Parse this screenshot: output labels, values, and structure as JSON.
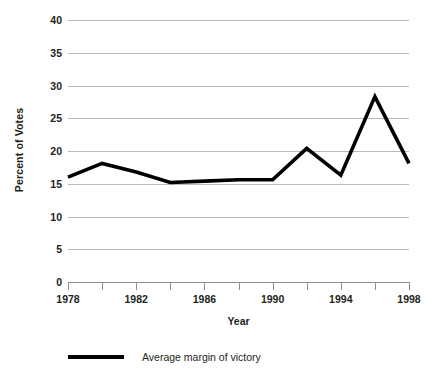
{
  "chart_data": {
    "type": "line",
    "title": "",
    "xlabel": "Year",
    "ylabel": "Percent of Votes",
    "x": [
      1978,
      1980,
      1982,
      1984,
      1986,
      1988,
      1990,
      1992,
      1994,
      1996,
      1998
    ],
    "series": [
      {
        "name": "Average margin of victory",
        "values": [
          16.0,
          18.1,
          16.8,
          15.2,
          15.4,
          15.6,
          15.6,
          20.4,
          16.3,
          28.3,
          18.1
        ],
        "color": "#000000"
      }
    ],
    "xlim": [
      1978,
      1998
    ],
    "ylim": [
      0,
      40
    ],
    "xticks": [
      1978,
      1980,
      1982,
      1984,
      1986,
      1988,
      1990,
      1992,
      1994,
      1996,
      1998
    ],
    "xtick_labels": [
      "1978",
      "",
      "1982",
      "",
      "1986",
      "",
      "1990",
      "",
      "1994",
      "",
      "1998"
    ],
    "yticks": [
      0,
      5,
      10,
      15,
      20,
      25,
      30,
      35,
      40
    ],
    "ytick_labels": [
      "0",
      "5",
      "10",
      "15",
      "20",
      "25",
      "30",
      "35",
      "40"
    ],
    "grid": true,
    "grid_axis": "y",
    "grid_color": "#b9b9b9",
    "legend_position": "bottom",
    "legend_entries": [
      "Average margin of victory"
    ],
    "background": "#ffffff",
    "axis_color": "#8f8f8f",
    "text_color": "#231f20"
  }
}
